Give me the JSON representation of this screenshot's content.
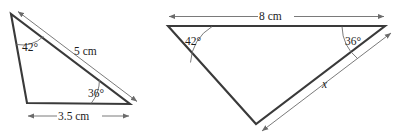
{
  "figure": {
    "type": "geometry-diagram",
    "background_color": "#ffffff",
    "stroke_color": "#3a3a3a",
    "dimension_color": "#6b6b6b"
  },
  "triangles": [
    {
      "id": "left-triangle",
      "labels": {
        "angle_top": "42°",
        "angle_top_value": "42",
        "angle_bottom_right": "36°",
        "angle_bottom_right_value": "36",
        "side_hypotenuse": "5 cm",
        "side_hypotenuse_value": "5",
        "side_base": "3.5 cm",
        "side_base_value": "3.5"
      }
    },
    {
      "id": "right-triangle",
      "labels": {
        "angle_top_left": "42°",
        "angle_top_left_value": "42",
        "angle_top_right": "36°",
        "angle_top_right_value": "36",
        "side_top": "8 cm",
        "side_top_value": "8",
        "side_right": "x",
        "side_right_value": "x"
      }
    }
  ]
}
